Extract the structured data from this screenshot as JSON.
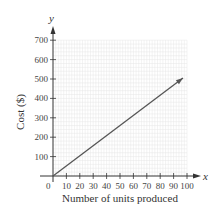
{
  "chart_data": {
    "type": "line",
    "title": "",
    "xlabel": "Number of units produced",
    "ylabel": "Cost ($)",
    "x_axis_var": "x",
    "y_axis_var": "y",
    "xlim": [
      0,
      100
    ],
    "ylim": [
      0,
      700
    ],
    "x_ticks": [
      10,
      20,
      30,
      40,
      50,
      60,
      70,
      80,
      90,
      100
    ],
    "y_ticks": [
      100,
      200,
      300,
      400,
      500,
      600,
      700
    ],
    "origin_label": "0",
    "grid": true,
    "legend": null,
    "series": [
      {
        "name": "Cost",
        "x": [
          0,
          97
        ],
        "y": [
          0,
          505
        ],
        "arrow_end": true,
        "color": "#555555"
      }
    ]
  },
  "colors": {
    "axis": "#333333",
    "grid": "#e6e6e6",
    "line": "#555555"
  }
}
